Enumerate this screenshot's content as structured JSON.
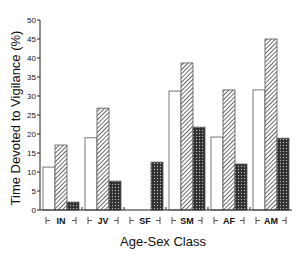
{
  "chart_data": {
    "type": "bar",
    "title": "",
    "xlabel": "Age-Sex Class",
    "ylabel": "Time Devoted to Vigilance (%)",
    "ylim": [
      0,
      50
    ],
    "yticks": [
      0,
      5,
      10,
      15,
      20,
      25,
      30,
      35,
      40,
      45,
      50
    ],
    "ytick_labels": [
      "0",
      "5",
      "10",
      "15",
      "20",
      "25",
      "30",
      "35",
      "40",
      "45",
      "50"
    ],
    "categories": [
      "IN",
      "JV",
      "SF",
      "SM",
      "AF",
      "AM"
    ],
    "grid": false,
    "legend": "none",
    "series": [
      {
        "name": "open",
        "pattern": "white",
        "values": [
          11.3,
          19.0,
          0,
          31.3,
          19.2,
          31.6
        ]
      },
      {
        "name": "diagonal-hatched",
        "pattern": "hatch",
        "values": [
          17.1,
          26.8,
          0,
          38.7,
          31.6,
          45.0
        ]
      },
      {
        "name": "dark-dotted",
        "pattern": "dots",
        "values": [
          2.1,
          7.6,
          12.6,
          21.8,
          12.1,
          18.9
        ]
      }
    ]
  },
  "colors": {
    "axis": "#222222",
    "bar_outline": "#555555",
    "dark_fill": "#3a3a3a"
  }
}
